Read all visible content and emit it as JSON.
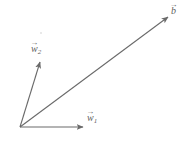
{
  "figure": {
    "background_color": "#ffffff",
    "stroke_color": "#6a6a6a",
    "label_color": "#5f5f5f",
    "width": 189,
    "height": 144
  },
  "origin": {
    "x": 20,
    "y": 127
  },
  "vectors": [
    {
      "id": "b",
      "label_base": "b",
      "subscript": "",
      "arrow_glyph": "→",
      "tail": {
        "x": 20,
        "y": 127
      },
      "tip": {
        "x": 168,
        "y": 17
      },
      "label_position": {
        "x": 171,
        "y": 6
      }
    },
    {
      "id": "w2",
      "label_base": "w",
      "subscript": "2",
      "arrow_glyph": "→",
      "tail": {
        "x": 20,
        "y": 127
      },
      "tip": {
        "x": 40,
        "y": 62
      },
      "label_position": {
        "x": 31,
        "y": 44
      }
    },
    {
      "id": "w1",
      "label_base": "w",
      "subscript": "1",
      "arrow_glyph": "→",
      "tail": {
        "x": 20,
        "y": 127
      },
      "tip": {
        "x": 83,
        "y": 127
      },
      "label_position": {
        "x": 87,
        "y": 113
      }
    }
  ],
  "artifacts": [
    {
      "id": "speck",
      "x": 40,
      "y": 32
    }
  ]
}
